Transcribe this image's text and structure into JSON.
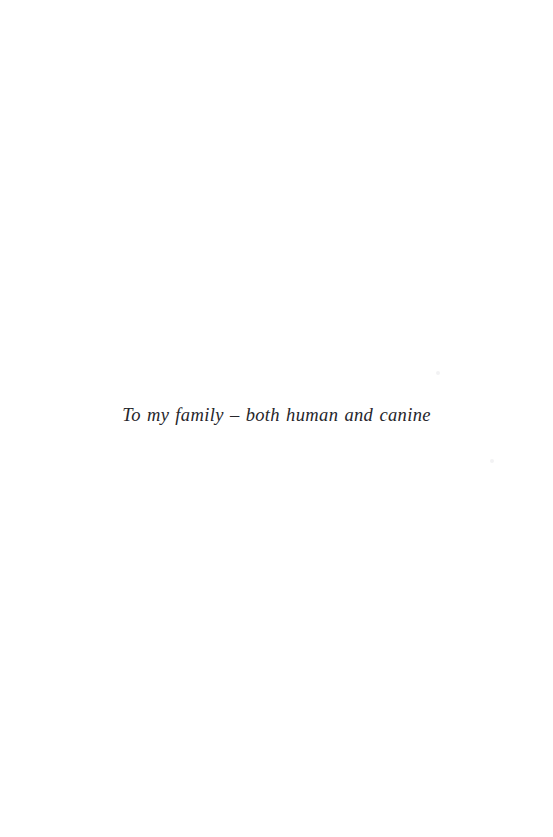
{
  "page": {
    "kind": "book-dedication-page",
    "background_color": "#ffffff",
    "width_px": 553,
    "height_px": 837
  },
  "dedication": {
    "text": "To my family – both human and canine",
    "text_color": "#26262b",
    "style": "italic-serif",
    "alignment": "center"
  },
  "artifacts": {
    "speck_color": "#f2f2f4",
    "upper_right_label": "scan-speck",
    "lower_right_label": "scan-speck"
  }
}
